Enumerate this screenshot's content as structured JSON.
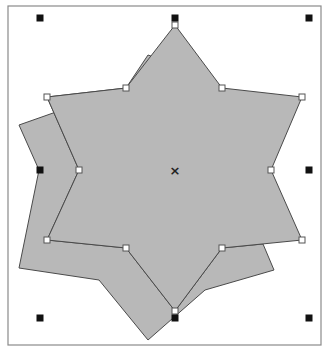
{
  "canvas": {
    "width": 329,
    "height": 353,
    "background": "#ffffff",
    "frame": {
      "x": 8,
      "y": 6,
      "width": 313,
      "height": 339,
      "stroke": "#8a8a8a"
    }
  },
  "colors": {
    "shape_fill": "#b8b8b8",
    "shape_stroke": "#4a4a4a",
    "handle_fill": "#111111",
    "node_fill": "#ffffff",
    "node_stroke": "#555555"
  },
  "shapes": {
    "back_star": {
      "points": "148,55 162,60 127,87 19,125 39,170 19,268 99,280 148,340 205,290 274,270 263,244 222,248 175,311 126,248 47,240 79,170 47,97 126,88"
    },
    "front_star": {
      "points": "175,25 222,88 302,97 271,170 302,240 222,248 175,311 126,248 47,240 79,170 47,97 126,88"
    }
  },
  "nodes": [
    {
      "x": 175,
      "y": 25
    },
    {
      "x": 222,
      "y": 88
    },
    {
      "x": 302,
      "y": 97
    },
    {
      "x": 271,
      "y": 170
    },
    {
      "x": 302,
      "y": 240
    },
    {
      "x": 222,
      "y": 248
    },
    {
      "x": 175,
      "y": 311
    },
    {
      "x": 126,
      "y": 248
    },
    {
      "x": 47,
      "y": 240
    },
    {
      "x": 79,
      "y": 170
    },
    {
      "x": 47,
      "y": 97
    },
    {
      "x": 126,
      "y": 88
    }
  ],
  "selection_handles": [
    {
      "name": "top-left",
      "x": 40,
      "y": 18
    },
    {
      "name": "top-center",
      "x": 175,
      "y": 18
    },
    {
      "name": "top-right",
      "x": 309,
      "y": 18
    },
    {
      "name": "middle-left",
      "x": 40,
      "y": 170
    },
    {
      "name": "middle-right",
      "x": 309,
      "y": 170
    },
    {
      "name": "bottom-left",
      "x": 40,
      "y": 318
    },
    {
      "name": "bottom-center",
      "x": 175,
      "y": 318
    },
    {
      "name": "bottom-right",
      "x": 309,
      "y": 318
    }
  ],
  "center_marker": {
    "x": 175,
    "y": 170,
    "glyph": "×"
  }
}
